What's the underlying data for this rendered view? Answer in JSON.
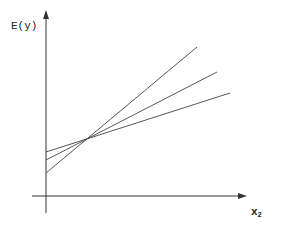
{
  "diagram": {
    "y_axis_label": "E(y)",
    "x_axis_label": "x",
    "x_axis_subscript": "2",
    "axis_color": "#333333",
    "line_color": "#444444",
    "lines": [
      {
        "name": "steep",
        "x1": 46,
        "y1": 173,
        "x2": 197,
        "y2": 47
      },
      {
        "name": "middle",
        "x1": 46,
        "y1": 160,
        "x2": 217,
        "y2": 72
      },
      {
        "name": "shallow",
        "x1": 46,
        "y1": 152,
        "x2": 230,
        "y2": 93
      }
    ]
  }
}
